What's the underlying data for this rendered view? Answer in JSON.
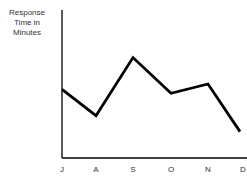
{
  "chart_data": {
    "type": "line",
    "title": "",
    "xlabel": "",
    "ylabel": "Response\nTime in\nMinutes",
    "categories": [
      "J",
      "A",
      "S",
      "O",
      "N",
      "D"
    ],
    "series": [
      {
        "name": "Response Time",
        "values": [
          52,
          32,
          76,
          49,
          56,
          20
        ]
      }
    ],
    "ylim": [
      0,
      112
    ],
    "grid": false,
    "legend": "none",
    "y_ticks_shown": false,
    "line_color": "#000000"
  }
}
